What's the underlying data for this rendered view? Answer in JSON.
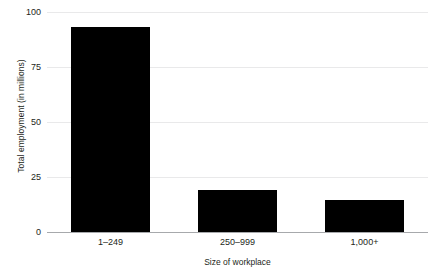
{
  "chart_data": {
    "type": "bar",
    "title": "",
    "subtitle": "",
    "xlabel": "Size of workplace",
    "ylabel": "Total employment (in millions)",
    "categories": [
      "1–249",
      "250–999",
      "1,000+"
    ],
    "values": [
      93,
      19,
      14.5
    ],
    "series": [
      {
        "name": "Total employment",
        "values": [
          93,
          19,
          14.5
        ]
      }
    ],
    "ylim": [
      0,
      100
    ],
    "yticks": [
      0,
      25,
      50,
      75,
      100
    ],
    "ytick_labels": [
      "0",
      "25",
      "50",
      "75",
      "100"
    ],
    "xtick_labels": [
      "1–249",
      "250–999",
      "1,000+"
    ],
    "grid": true,
    "grid_axis": "y",
    "legend": false,
    "legend_position": "none",
    "bar_color": "#000000",
    "grid_color": "#e9e9ea",
    "axis_color": "#a7a9ac",
    "text_color": "#231f20",
    "background_color": "#ffffff",
    "annotations": []
  }
}
